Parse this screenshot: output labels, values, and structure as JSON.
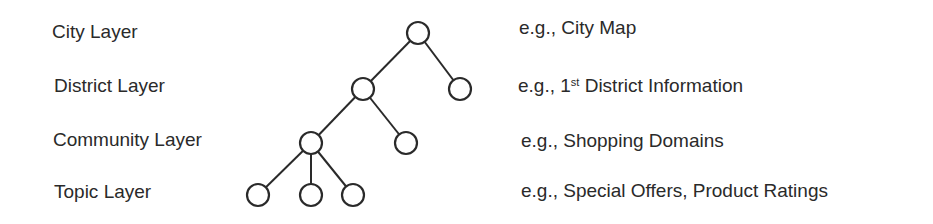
{
  "layers": [
    {
      "label": "City Layer",
      "example_prefix": "e.g., City Map",
      "example_sup": "",
      "example_suffix": ""
    },
    {
      "label": "District Layer",
      "example_prefix": "e.g., 1",
      "example_sup": "st",
      "example_suffix": " District Information"
    },
    {
      "label": "Community Layer",
      "example_prefix": "e.g., Shopping Domains",
      "example_sup": "",
      "example_suffix": ""
    },
    {
      "label": "Topic Layer",
      "example_prefix": "e.g., Special Offers, Product Ratings",
      "example_sup": "",
      "example_suffix": ""
    }
  ],
  "tree": {
    "node_color": "#2a2a2a",
    "nodes": [
      {
        "id": "city-root",
        "layer": "City"
      },
      {
        "id": "district-1",
        "layer": "District"
      },
      {
        "id": "district-2",
        "layer": "District"
      },
      {
        "id": "community-1",
        "layer": "Community"
      },
      {
        "id": "community-2",
        "layer": "Community"
      },
      {
        "id": "topic-1",
        "layer": "Topic"
      },
      {
        "id": "topic-2",
        "layer": "Topic"
      },
      {
        "id": "topic-3",
        "layer": "Topic"
      }
    ],
    "edges": [
      [
        "city-root",
        "district-1"
      ],
      [
        "city-root",
        "district-2"
      ],
      [
        "district-1",
        "community-1"
      ],
      [
        "district-1",
        "community-2"
      ],
      [
        "community-1",
        "topic-1"
      ],
      [
        "community-1",
        "topic-2"
      ],
      [
        "community-1",
        "topic-3"
      ]
    ]
  }
}
